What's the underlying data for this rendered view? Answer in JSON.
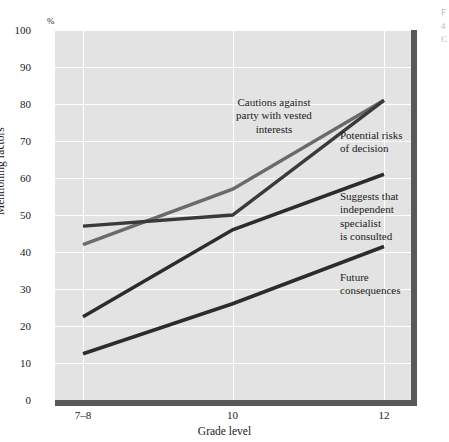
{
  "chart_data": {
    "type": "line",
    "title": "",
    "subtitle": "",
    "xlabel": "Grade level",
    "ylabel": "Mentioning factors",
    "unit_symbol": "%",
    "categories": [
      "7–8",
      "10",
      "12"
    ],
    "x_tick_labels": [
      "7–8",
      "10",
      "12"
    ],
    "y_tick_labels": [
      "0",
      "10",
      "20",
      "30",
      "40",
      "50",
      "60",
      "70",
      "80",
      "90",
      "100"
    ],
    "y_ticks": [
      0,
      10,
      20,
      30,
      40,
      50,
      60,
      70,
      80,
      90,
      100
    ],
    "ylim": [
      0,
      100
    ],
    "grid": true,
    "grid_color": "#ffffff",
    "plot_background": "#e3e3e3",
    "legend_position": "inline-annotations",
    "series": [
      {
        "name": "Cautions against party with vested interests",
        "values": [
          42,
          57,
          81
        ],
        "color": "#6a6a6a",
        "line_width": 3.4
      },
      {
        "name": "Potential risks of decision",
        "values": [
          47,
          50,
          81
        ],
        "color": "#3a3a3a",
        "line_width": 3.4
      },
      {
        "name": "Suggests that independent specialist is consulted",
        "values": [
          22.5,
          46,
          61
        ],
        "color": "#2c2c2c",
        "line_width": 3.6
      },
      {
        "name": "Future consequences",
        "values": [
          12.5,
          26,
          41.5
        ],
        "color": "#2c2c2c",
        "line_width": 3.6
      }
    ],
    "annotations": [
      {
        "id": "cautions",
        "text": "Cautions against\nparty with vested\ninterests",
        "align": "center"
      },
      {
        "id": "risks",
        "text": "Potential risks\nof decision",
        "align": "left"
      },
      {
        "id": "suggests",
        "text": "Suggests that\nindependent\nspecialist\nis consulted",
        "align": "left"
      },
      {
        "id": "future",
        "text": "Future\nconsequences",
        "align": "left"
      }
    ]
  },
  "edge_caption": "F\n4\nC"
}
